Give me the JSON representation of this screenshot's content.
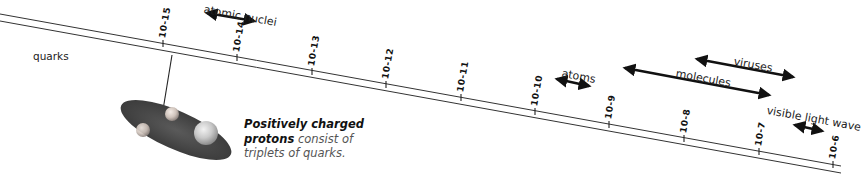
{
  "diagram": {
    "scale": {
      "ticks": [
        {
          "label": "10-15",
          "x": 163,
          "y": 47
        },
        {
          "label": "10-14",
          "x": 237,
          "y": 61
        },
        {
          "label": "10-13",
          "x": 312,
          "y": 75
        },
        {
          "label": "10-12",
          "x": 386,
          "y": 88
        },
        {
          "label": "10-11",
          "x": 461,
          "y": 101
        },
        {
          "label": "10-10",
          "x": 535,
          "y": 115
        },
        {
          "label": "10-9",
          "x": 609,
          "y": 128
        },
        {
          "label": "10-8",
          "x": 684,
          "y": 142
        },
        {
          "label": "10-7",
          "x": 759,
          "y": 155
        },
        {
          "label": "10-6",
          "x": 833,
          "y": 168
        }
      ]
    },
    "ranges": [
      {
        "label": "atomic nuclei",
        "x1": 207,
        "y1": 13,
        "x2": 254,
        "y2": 21,
        "tx": 205,
        "ty": 3
      },
      {
        "label": "atoms",
        "x1": 557,
        "y1": 79,
        "x2": 589,
        "y2": 86,
        "tx": 563,
        "ty": 67
      },
      {
        "label": "molecules",
        "x1": 625,
        "y1": 68,
        "x2": 769,
        "y2": 95,
        "tx": 677,
        "ty": 67
      },
      {
        "label": "viruses",
        "x1": 697,
        "y1": 59,
        "x2": 793,
        "y2": 77,
        "tx": 735,
        "ty": 55
      },
      {
        "label": "visible light wave",
        "x1": 795,
        "y1": 125,
        "x2": 822,
        "y2": 131,
        "tx": 768,
        "ty": 104
      }
    ],
    "quarks_label": "quarks",
    "caption": {
      "bold": "Positively charged protons",
      "bold_line1": "Positively charged",
      "bold_line2": "protons",
      "rest_line2": " consist of",
      "line3": "triplets of quarks."
    },
    "colors": {
      "ruler": "#333333",
      "arrow": "#111111",
      "proton_disc": "#4a4a4a",
      "sphere": "#c8c8c8"
    }
  }
}
